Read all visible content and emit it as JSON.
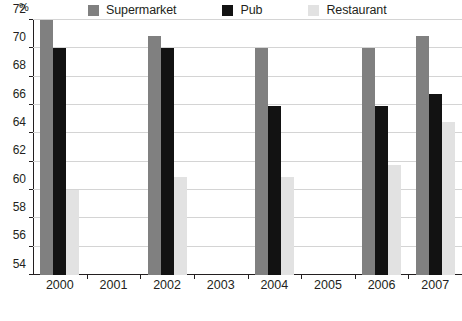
{
  "chart_data": {
    "type": "bar",
    "title": "",
    "xlabel": "",
    "ylabel": "%",
    "ylim": [
      54,
      72
    ],
    "ytick_step": 2,
    "grid": true,
    "legend_position": "top",
    "categories": [
      "2000",
      "2001",
      "2002",
      "2003",
      "2004",
      "2005",
      "2006",
      "2007"
    ],
    "yticks": [
      "72",
      "70",
      "68",
      "66",
      "64",
      "62",
      "60",
      "58",
      "56",
      "54"
    ],
    "series": [
      {
        "name": "Supermarket",
        "color": "#808080",
        "values": [
          72.0,
          null,
          70.9,
          null,
          70.0,
          null,
          70.0,
          70.9
        ]
      },
      {
        "name": "Pub",
        "color": "#121212",
        "values": [
          70.0,
          null,
          70.0,
          null,
          65.9,
          null,
          65.9,
          66.8
        ]
      },
      {
        "name": "Restaurant",
        "color": "#e2e2e2",
        "values": [
          60.0,
          null,
          60.9,
          null,
          60.9,
          null,
          61.8,
          64.8
        ]
      }
    ]
  },
  "legend": {
    "items": [
      {
        "label": "Supermarket",
        "color": "#808080"
      },
      {
        "label": "Pub",
        "color": "#121212"
      },
      {
        "label": "Restaurant",
        "color": "#e2e2e2"
      }
    ]
  },
  "axes": {
    "unit_label": "%"
  },
  "source_note": ""
}
